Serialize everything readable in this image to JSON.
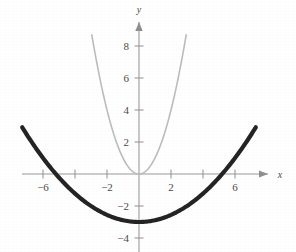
{
  "figure": {
    "title": "",
    "x_axis_label": "x",
    "y_axis_label": "y"
  },
  "chart_data": {
    "type": "line",
    "title": "",
    "xlabel": "x",
    "ylabel": "y",
    "xlim": [
      -7.4,
      7.8
    ],
    "ylim": [
      -4.8,
      9.6
    ],
    "grid": false,
    "legend": "none",
    "origin_px": {
      "x": 139,
      "y": 174
    },
    "pixels_per_unit": 16,
    "x_ticks": [
      -6,
      -4,
      -2,
      2,
      4,
      6
    ],
    "x_tick_labels": [
      "−6",
      "",
      "−2",
      "2",
      "",
      "6"
    ],
    "y_ticks": [
      -4,
      -2,
      2,
      4,
      6,
      8
    ],
    "y_tick_labels": [
      "−4",
      "−2",
      "2",
      "4",
      "6",
      "8"
    ],
    "series": [
      {
        "name": "narrow parabola",
        "equation": "y = x^2",
        "color": "#bcbcbc",
        "linewidth": 1.6,
        "vertex": [
          0,
          0
        ],
        "x_domain": [
          -2.95,
          2.95
        ],
        "x": [
          -2.95,
          -2.6,
          -2.2,
          -1.8,
          -1.4,
          -1.0,
          -0.6,
          -0.3,
          0,
          0.3,
          0.6,
          1.0,
          1.4,
          1.8,
          2.2,
          2.6,
          2.95
        ],
        "values": [
          8.7,
          6.76,
          4.84,
          3.24,
          1.96,
          1.0,
          0.36,
          0.09,
          0,
          0.09,
          0.36,
          1.0,
          1.96,
          3.24,
          4.84,
          6.76,
          8.7
        ]
      },
      {
        "name": "wide shifted parabola",
        "equation": "y = x^2/9 − 3",
        "color": "#242424",
        "linewidth": 4.2,
        "vertex": [
          0,
          -3
        ],
        "x_domain": [
          -7.3,
          7.3
        ],
        "x": [
          -7.3,
          -6.5,
          -5.5,
          -4.5,
          -3.5,
          -2.5,
          -1.5,
          -0.75,
          0,
          0.75,
          1.5,
          2.5,
          3.5,
          4.5,
          5.5,
          6.5,
          7.3
        ],
        "values": [
          2.92,
          1.69,
          0.36,
          -0.75,
          -1.64,
          -2.31,
          -2.75,
          -2.94,
          -3,
          -2.94,
          -2.75,
          -2.31,
          -1.64,
          -0.75,
          0.36,
          1.69,
          2.92
        ]
      }
    ],
    "axis_color": "#9a9a9a",
    "tick_label_color": "#4a4a4a"
  }
}
